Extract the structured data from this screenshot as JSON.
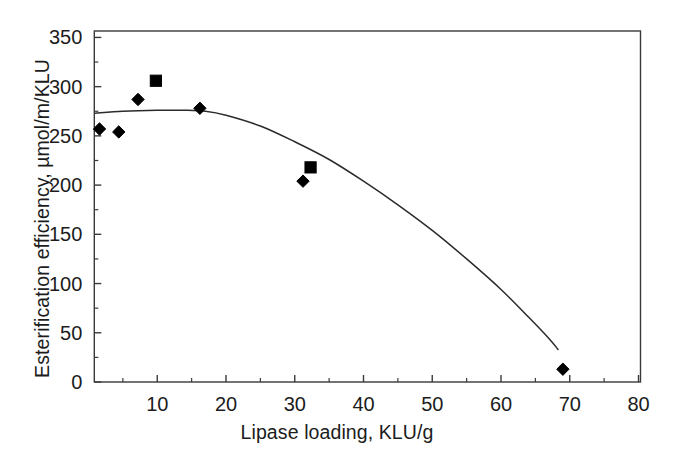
{
  "chart_data": {
    "type": "scatter",
    "title": "",
    "xlabel": "Lipase loading, KLU/g",
    "ylabel": "Esterification efficiency, µmol/m/KLU",
    "xlim": [
      0.8,
      80
    ],
    "ylim": [
      0,
      357
    ],
    "xticks": [
      10,
      20,
      30,
      40,
      50,
      60,
      70,
      80
    ],
    "xtick_labels": [
      "10",
      "20",
      "30",
      "40",
      "50",
      "60",
      "70",
      "80"
    ],
    "xminor_step": 5,
    "yticks": [
      0,
      50,
      100,
      150,
      200,
      250,
      300,
      350
    ],
    "ytick_labels": [
      "0",
      "50",
      "100",
      "150",
      "200",
      "250",
      "300",
      "350"
    ],
    "yminor_step": 25,
    "grid": false,
    "legend": null,
    "series": [
      {
        "name": "diamond-markers",
        "marker": "diamond",
        "color": "#000000",
        "points": [
          {
            "x": 1.6,
            "y": 257
          },
          {
            "x": 4.4,
            "y": 254
          },
          {
            "x": 7.2,
            "y": 287
          },
          {
            "x": 16.2,
            "y": 278
          },
          {
            "x": 31.2,
            "y": 204
          },
          {
            "x": 69.0,
            "y": 13
          }
        ]
      },
      {
        "name": "square-markers",
        "marker": "square",
        "color": "#000000",
        "points": [
          {
            "x": 9.8,
            "y": 306
          },
          {
            "x": 32.3,
            "y": 218
          }
        ]
      },
      {
        "name": "fitted-curve",
        "marker": "none",
        "line": "solid",
        "color": "#2b2b2b",
        "points": [
          {
            "x": 1.0,
            "y": 273
          },
          {
            "x": 5.0,
            "y": 275
          },
          {
            "x": 10.0,
            "y": 276
          },
          {
            "x": 14.0,
            "y": 276
          },
          {
            "x": 17.0,
            "y": 275
          },
          {
            "x": 20.0,
            "y": 271
          },
          {
            "x": 25.0,
            "y": 260
          },
          {
            "x": 30.0,
            "y": 244
          },
          {
            "x": 35.0,
            "y": 226
          },
          {
            "x": 40.0,
            "y": 204
          },
          {
            "x": 45.0,
            "y": 180
          },
          {
            "x": 50.0,
            "y": 154
          },
          {
            "x": 55.0,
            "y": 125
          },
          {
            "x": 60.0,
            "y": 94
          },
          {
            "x": 64.0,
            "y": 66
          },
          {
            "x": 67.0,
            "y": 44
          },
          {
            "x": 68.3,
            "y": 33
          }
        ]
      }
    ]
  },
  "axes": {
    "frame_color": "#3a3a3a",
    "tick_color": "#3a3a3a",
    "background": "#ffffff"
  }
}
